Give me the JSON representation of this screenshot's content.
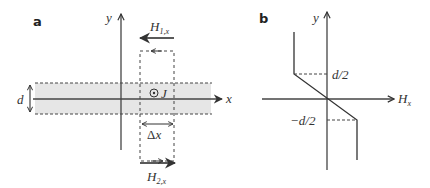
{
  "panel_a": {
    "label": "a",
    "y_axis_label": "y",
    "x_axis_label": "x",
    "thickness_label": "d",
    "current_symbol": "⊙",
    "current_label": "J",
    "field_top": {
      "main": "H",
      "sub": "1,x"
    },
    "field_bottom": {
      "main": "H",
      "sub": "2,x"
    },
    "width_label": {
      "delta": "Δ",
      "var": "x"
    },
    "colors": {
      "band": "#e8e8e8",
      "line": "#444444"
    }
  },
  "panel_b": {
    "label": "b",
    "y_axis_label": "y",
    "x_axis_label": {
      "main": "H",
      "sub": "x"
    },
    "upper_mark": "d/2",
    "lower_mark": "−d/2",
    "curve_points": [
      [
        294,
        32
      ],
      [
        294,
        74
      ],
      [
        357,
        120
      ],
      [
        357,
        160
      ]
    ]
  }
}
